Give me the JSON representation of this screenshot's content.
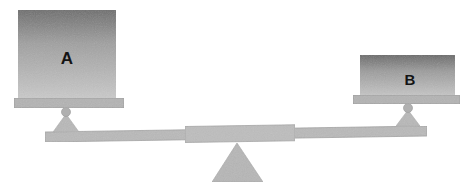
{
  "diagram": {
    "type": "lever-balance",
    "background_color": "#ffffff"
  },
  "blocks": [
    {
      "id": "A",
      "label": "A",
      "label_color": "#141414",
      "label_font_size": 17,
      "x": 18,
      "y": 10,
      "width": 98,
      "height": 88,
      "gradient_top_color": "#6e6e6e",
      "gradient_bottom_color": "#c9c9c9",
      "label_cx": 67,
      "label_cy": 58
    },
    {
      "id": "B",
      "label": "B",
      "label_color": "#141414",
      "label_font_size": 15,
      "x": 360,
      "y": 55,
      "width": 95,
      "height": 40,
      "gradient_top_color": "#6a6a6a",
      "gradient_bottom_color": "#c4c4c4",
      "label_cx": 410,
      "label_cy": 79
    }
  ],
  "pans": [
    {
      "side": "left",
      "x": 14,
      "y": 98,
      "width": 110,
      "height": 10,
      "fill": "#b3b3b3",
      "stroke": "#9a9a9a"
    },
    {
      "side": "right",
      "x": 353,
      "y": 95,
      "width": 107,
      "height": 9,
      "fill": "#b3b3b3",
      "stroke": "#9a9a9a"
    }
  ],
  "pivot_balls": [
    {
      "side": "left",
      "cx": 66,
      "cy": 112,
      "r": 4.5,
      "fill": "#b0b0b0"
    },
    {
      "side": "right",
      "cx": 408,
      "cy": 108,
      "r": 4.5,
      "fill": "#b0b0b0"
    }
  ],
  "pivot_wedges": [
    {
      "side": "left",
      "apex_x": 66,
      "apex_y": 114,
      "left_x": 53,
      "right_x": 79,
      "base_y": 132,
      "fill": "#b8b8b8"
    },
    {
      "side": "right",
      "apex_x": 408,
      "apex_y": 110,
      "left_x": 396,
      "right_x": 420,
      "base_y": 126,
      "fill": "#b8b8b8"
    }
  ],
  "beam": {
    "left_x": 45,
    "left_top_y": 132,
    "right_x": 427,
    "right_top_y": 126,
    "thickness": 10,
    "fill": "#b9b9b9",
    "stroke": "#a0a0a0",
    "center_segment": {
      "start_x": 185,
      "end_x": 295,
      "extra_thickness": 6,
      "fill": "#bdbdbd",
      "stroke": "#a3a3a3"
    }
  },
  "fulcrum": {
    "apex_x": 237,
    "apex_y": 143,
    "left_x": 212,
    "right_x": 263,
    "base_y": 182,
    "fill": "#b6b6b6",
    "stroke": "#a8a8a8"
  }
}
